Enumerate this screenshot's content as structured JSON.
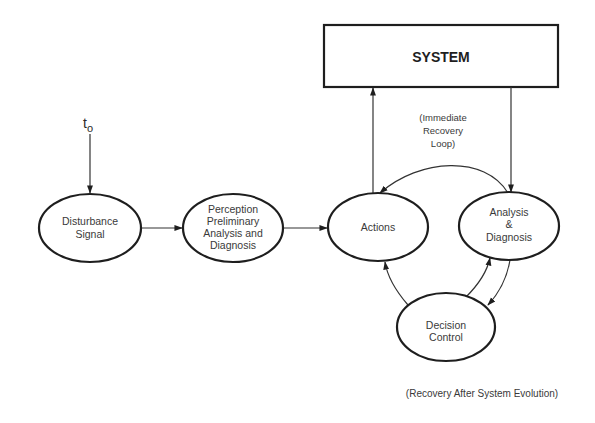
{
  "diagram": {
    "start_marker": {
      "base": "t",
      "subscript": "o"
    },
    "nodes": {
      "system": {
        "label": "SYSTEM",
        "shape": "rectangle"
      },
      "disturbance": {
        "lines": [
          "Disturbance",
          "Signal"
        ],
        "shape": "ellipse"
      },
      "perception": {
        "lines": [
          "Perception",
          "Preliminary",
          "Analysis and",
          "Diagnosis"
        ],
        "shape": "ellipse"
      },
      "actions": {
        "lines": [
          "Actions"
        ],
        "shape": "ellipse"
      },
      "analysis": {
        "lines": [
          "Analysis",
          "&",
          "Diagnosis"
        ],
        "shape": "ellipse"
      },
      "decision": {
        "lines": [
          "Decision",
          "Control"
        ],
        "shape": "ellipse"
      }
    },
    "annotations": {
      "immediate_loop": [
        "(Immediate",
        "Recovery",
        "Loop)"
      ],
      "evolution_caption": "(Recovery After System Evolution)"
    },
    "edges": [
      {
        "from": "t_o",
        "to": "disturbance"
      },
      {
        "from": "disturbance",
        "to": "perception"
      },
      {
        "from": "perception",
        "to": "actions"
      },
      {
        "from": "actions",
        "to": "system"
      },
      {
        "from": "system",
        "to": "analysis"
      },
      {
        "from": "analysis",
        "to": "actions",
        "label": "Immediate Recovery Loop"
      },
      {
        "from": "analysis",
        "to": "decision"
      },
      {
        "from": "decision",
        "to": "analysis"
      },
      {
        "from": "decision",
        "to": "actions"
      }
    ],
    "colors": {
      "stroke": "#1e1e1e",
      "text": "#3a3a3a",
      "background": "#ffffff"
    }
  }
}
